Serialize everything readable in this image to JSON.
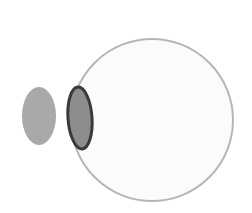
{
  "figure": {
    "name": "eye-lens-object-diagram",
    "width": 252,
    "height": 213,
    "background_color": "#ffffff",
    "description": "Simple optical schematic: a small gray ellipse (object) at left, a narrow dark-outlined lens ellipse, and a large pale circle (eye globe) at right.",
    "shapes": {
      "object_ellipse": {
        "label": "object-ellipse",
        "cx": 39,
        "cy": 116,
        "rx": 17,
        "ry": 29,
        "fill": "#a9a9a9",
        "stroke": "none",
        "stroke_width": 0
      },
      "lens_ellipse": {
        "label": "lens-ellipse",
        "cx": 80,
        "cy": 118,
        "rx": 12,
        "ry": 31,
        "rotation_deg": -4,
        "fill": "#8d8d8d",
        "stroke": "#3a3a3a",
        "stroke_width": 3
      },
      "globe_circle": {
        "label": "globe-circle",
        "cx": 152,
        "cy": 120,
        "r": 81,
        "fill": "#fbfbfb",
        "stroke": "#b6b6b6",
        "stroke_width": 2
      }
    }
  }
}
